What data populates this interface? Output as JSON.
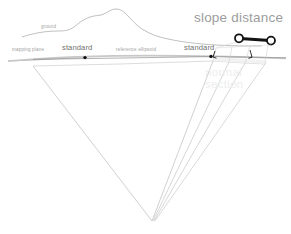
{
  "diagram": {
    "title": "slope distance",
    "labels": {
      "ground": "ground",
      "mapping_plane": "mapping plane",
      "standard_left": "standard",
      "reference_ellipsoid": "reference ellipsoid",
      "standard_right": "standard",
      "normal_section_line1": "normal",
      "normal_section_line2": "section"
    },
    "colors": {
      "title_gray": "#9d9d9d",
      "label_gray": "#a2a2a2",
      "label_dark_gray": "#6f6f6f",
      "faint_gray": "#ededed",
      "line_gray": "#b4b4b4",
      "cone_gray": "#bfbfbf",
      "marker_black": "#111111",
      "background": "#ffffff"
    },
    "markers": {
      "endpoint_left": "open-circle",
      "endpoint_right": "open-circle",
      "station_left": "filled-dot",
      "station_right": "filled-dot"
    }
  }
}
